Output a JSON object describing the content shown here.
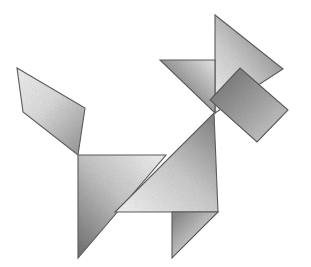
{
  "figure": {
    "background_color": "#ffffff",
    "stroke_color": "#5d5d5d",
    "canvas": {
      "width": 311,
      "height": 267
    },
    "style": "graphite pencil shaded tangram puzzle, seven pieces"
  },
  "pieces": [
    {
      "id": "tail-parallelogram",
      "name": "Tail parallelogram",
      "shape": "parallelogram",
      "points": "17,68 85,108 78,155 23,112",
      "fill_light": "#e3e3e3",
      "fill_dark": "#9a9a9a",
      "gradient_angle": 120
    },
    {
      "id": "head-large-triangle",
      "name": "Head large triangle",
      "shape": "triangle",
      "points": "215,15 215,113 283,69",
      "fill_light": "#e8e8e8",
      "fill_dark": "#8a8a8a",
      "gradient_angle": 30
    },
    {
      "id": "snout-medium-triangle",
      "name": "Snout medium triangle",
      "shape": "triangle",
      "points": "160,60 215,60 215,113",
      "fill_light": "#d4d4d4",
      "fill_dark": "#6f6f6f",
      "gradient_angle": 200
    },
    {
      "id": "ear-square",
      "name": "Ear square",
      "shape": "square",
      "points": "240,68 288,110 257,142 210,100",
      "fill_light": "#cccccc",
      "fill_dark": "#7a7a7a",
      "gradient_angle": 300
    },
    {
      "id": "body-left-large-triangle",
      "name": "Body left large triangle",
      "shape": "triangle",
      "points": "78,155 166,155 78,258",
      "fill_light": "#e0e0e0",
      "fill_dark": "#7f7f7f",
      "gradient_angle": 45
    },
    {
      "id": "body-right-large-triangle",
      "name": "Body right large triangle",
      "shape": "triangle",
      "points": "214,113 218,212 115,212",
      "fill_light": "#e6e6e6",
      "fill_dark": "#8d8d8d",
      "gradient_angle": 330
    },
    {
      "id": "leg-small-triangle",
      "name": "Leg small triangle",
      "shape": "triangle",
      "points": "172,212 218,212 172,258",
      "fill_light": "#d8d8d8",
      "fill_dark": "#888888",
      "gradient_angle": 250
    }
  ]
}
